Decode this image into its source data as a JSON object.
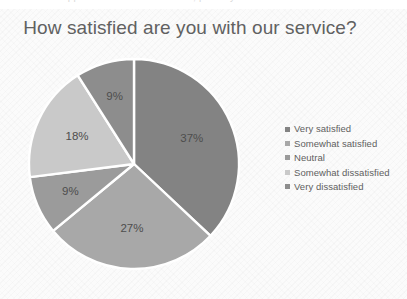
{
  "document": {
    "cropped_top_text": "appear above the chart area, partially cut off"
  },
  "chart": {
    "title": "How satisfied are you with our service?",
    "title_color": "#616161",
    "background_color": "#fbfbfb",
    "slice_separator_color": "#ffffff",
    "label_color": "#4d4d4d"
  },
  "legend": {
    "position": "right",
    "items": [
      {
        "label": "Very satisfied",
        "color": "#838383"
      },
      {
        "label": "Somewhat satisfied",
        "color": "#a8a8a8"
      },
      {
        "label": "Neutral",
        "color": "#9b9b9b"
      },
      {
        "label": "Somewhat dissatisfied",
        "color": "#c9c9c9"
      },
      {
        "label": "Very dissatisfied",
        "color": "#8d8d8d"
      }
    ]
  },
  "chart_data": {
    "type": "pie",
    "title": "How satisfied are you with our service?",
    "xlabel": "",
    "ylabel": "",
    "legend_position": "right",
    "grid": false,
    "start_angle_deg": 0,
    "direction": "clockwise",
    "categories": [
      "Very satisfied",
      "Somewhat satisfied",
      "Neutral",
      "Somewhat dissatisfied",
      "Very dissatisfied"
    ],
    "values": [
      37,
      27,
      9,
      18,
      9
    ],
    "data_labels": [
      "37%",
      "27%",
      "9%",
      "18%",
      "9%"
    ],
    "colors": [
      "#838383",
      "#a8a8a8",
      "#9b9b9b",
      "#c9c9c9",
      "#8d8d8d"
    ],
    "units": "percent",
    "total": 100
  }
}
